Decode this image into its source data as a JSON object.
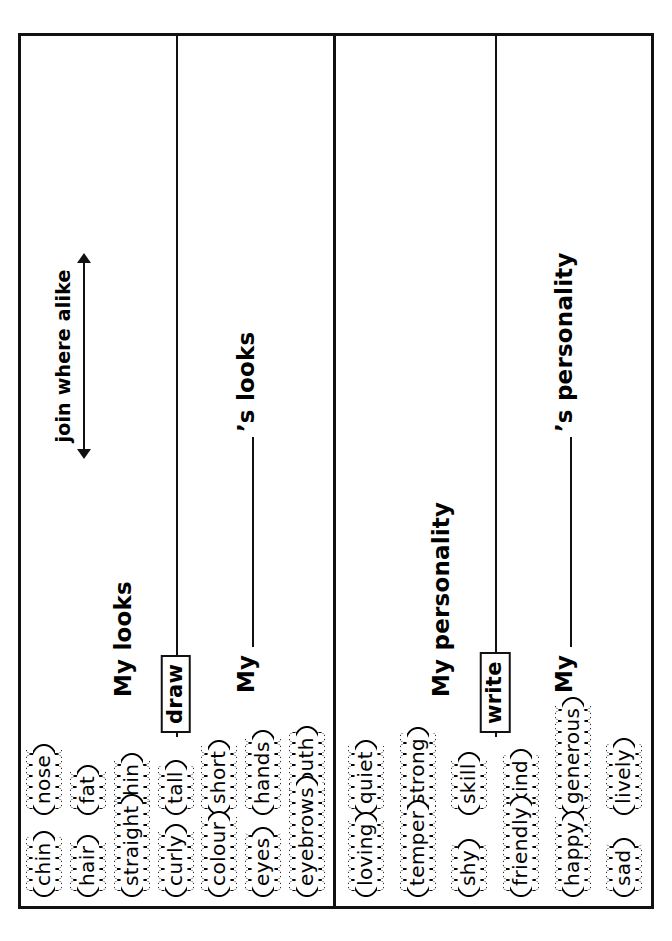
{
  "worksheet": {
    "annotation": {
      "label": "join where alike",
      "arrow": "double-headed-arrow"
    },
    "panels": [
      {
        "id": "looks",
        "section_title": "My looks",
        "tag": "draw",
        "prompt_prefix": "My",
        "prompt_suffix": "’s looks",
        "words": [
          "chin",
          "nose",
          "fat",
          "hair",
          "thin",
          "straight",
          "tall",
          "curly",
          "short",
          "colour",
          "hands",
          "eyes",
          "mouth",
          "eyebrows"
        ],
        "word_rows": {
          "upper": [
            "nose",
            "fat",
            "thin",
            "tall",
            "short",
            "hands",
            "mouth"
          ],
          "lower": [
            "chin",
            "hair",
            "straight",
            "curly",
            "colour",
            "eyes",
            "eyebrows"
          ]
        }
      },
      {
        "id": "personality",
        "section_title": "My personality",
        "tag": "write",
        "prompt_prefix": "My",
        "prompt_suffix": "’s personality",
        "words": [
          "loving",
          "quiet",
          "temper",
          "strong",
          "shy",
          "skill",
          "friendly",
          "kind",
          "happy",
          "generous",
          "sad",
          "lively"
        ],
        "word_rows": {
          "upper": [
            "quiet",
            "strong",
            "skill",
            "kind",
            "generous",
            "lively"
          ],
          "lower": [
            "loving",
            "temper",
            "shy",
            "friendly",
            "happy",
            "sad"
          ]
        }
      }
    ]
  },
  "colors": {
    "ink": "#111111",
    "paper": "#ffffff"
  }
}
